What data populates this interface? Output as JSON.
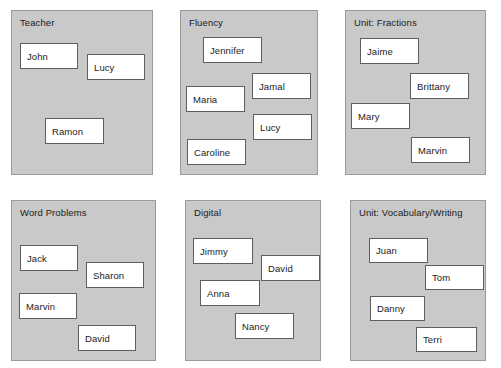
{
  "diagram": {
    "type": "grouping-boxes",
    "panels": [
      {
        "title": "Teacher",
        "x": 11,
        "y": 10,
        "w": 142,
        "h": 165,
        "boxes": [
          {
            "label": "John",
            "x": 8,
            "y": 32,
            "w": 58,
            "h": 26
          },
          {
            "label": "Lucy",
            "x": 75,
            "y": 43,
            "w": 58,
            "h": 26
          },
          {
            "label": "Ramon",
            "x": 33,
            "y": 107,
            "w": 59,
            "h": 26
          }
        ]
      },
      {
        "title": "Fluency",
        "x": 180,
        "y": 10,
        "w": 138,
        "h": 165,
        "boxes": [
          {
            "label": "Jennifer",
            "x": 22,
            "y": 26,
            "w": 59,
            "h": 26
          },
          {
            "label": "Jamal",
            "x": 71,
            "y": 62,
            "w": 59,
            "h": 26
          },
          {
            "label": "Maria",
            "x": 5,
            "y": 75,
            "w": 59,
            "h": 26
          },
          {
            "label": "Lucy",
            "x": 72,
            "y": 103,
            "w": 59,
            "h": 26
          },
          {
            "label": "Caroline",
            "x": 6,
            "y": 128,
            "w": 59,
            "h": 26
          }
        ]
      },
      {
        "title": "Unit: Fractions",
        "x": 345,
        "y": 10,
        "w": 141,
        "h": 165,
        "boxes": [
          {
            "label": "Jaime",
            "x": 14,
            "y": 27,
            "w": 59,
            "h": 26
          },
          {
            "label": "Brittany",
            "x": 64,
            "y": 62,
            "w": 59,
            "h": 26
          },
          {
            "label": "Mary",
            "x": 5,
            "y": 92,
            "w": 59,
            "h": 26
          },
          {
            "label": "Marvin",
            "x": 65,
            "y": 126,
            "w": 59,
            "h": 26
          }
        ]
      },
      {
        "title": "Word Problems",
        "x": 11,
        "y": 200,
        "w": 145,
        "h": 161,
        "boxes": [
          {
            "label": "Jack",
            "x": 8,
            "y": 44,
            "w": 58,
            "h": 26
          },
          {
            "label": "Sharon",
            "x": 74,
            "y": 61,
            "w": 58,
            "h": 26
          },
          {
            "label": "Marvin",
            "x": 7,
            "y": 92,
            "w": 58,
            "h": 26
          },
          {
            "label": "David",
            "x": 66,
            "y": 124,
            "w": 58,
            "h": 26
          }
        ]
      },
      {
        "title": "Digital",
        "x": 185,
        "y": 200,
        "w": 136,
        "h": 161,
        "boxes": [
          {
            "label": "Jimmy",
            "x": 7,
            "y": 37,
            "w": 60,
            "h": 26
          },
          {
            "label": "David",
            "x": 75,
            "y": 54,
            "w": 59,
            "h": 26
          },
          {
            "label": "Anna",
            "x": 14,
            "y": 79,
            "w": 60,
            "h": 26
          },
          {
            "label": "Nancy",
            "x": 49,
            "y": 112,
            "w": 59,
            "h": 26
          }
        ]
      },
      {
        "title": "Unit: Vocabulary/Writing",
        "x": 350,
        "y": 200,
        "w": 136,
        "h": 161,
        "boxes": [
          {
            "label": "Juan",
            "x": 18,
            "y": 37,
            "w": 59,
            "h": 25
          },
          {
            "label": "Tom",
            "x": 74,
            "y": 64,
            "w": 59,
            "h": 25
          },
          {
            "label": "Danny",
            "x": 19,
            "y": 95,
            "w": 55,
            "h": 25
          },
          {
            "label": "Terri",
            "x": 65,
            "y": 126,
            "w": 61,
            "h": 25
          }
        ]
      }
    ]
  },
  "colors": {
    "panel_fill": "#c9c9c9",
    "panel_border": "#9a9a9a",
    "box_fill": "#ffffff",
    "box_border": "#5e5e5e",
    "text": "#1b1b1b",
    "page_background": "#ffffff"
  }
}
